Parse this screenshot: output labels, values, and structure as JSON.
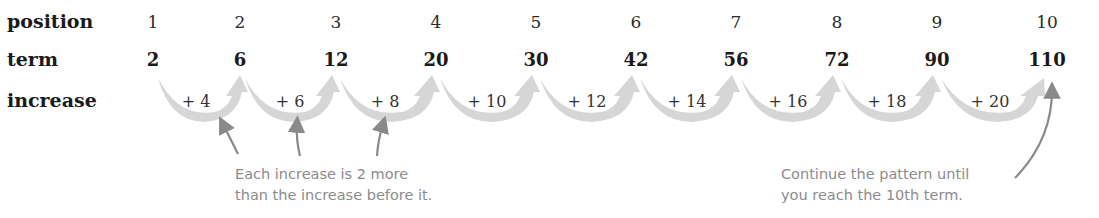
{
  "labels": {
    "position": "position",
    "term": "term",
    "increase": "increase"
  },
  "positions": [
    "1",
    "2",
    "3",
    "4",
    "5",
    "6",
    "7",
    "8",
    "9",
    "10"
  ],
  "terms": [
    "2",
    "6",
    "12",
    "20",
    "30",
    "42",
    "56",
    "72",
    "90",
    "110"
  ],
  "increases": [
    "+ 4",
    "+ 6",
    "+ 8",
    "+ 10",
    "+ 12",
    "+ 14",
    "+ 16",
    "+ 18",
    "+ 20"
  ],
  "notes": {
    "left_line1": "Each increase is 2 more",
    "left_line2": "than the increase before it.",
    "right_line1": "Continue the pattern until",
    "right_line2": "you reach the 10th term."
  },
  "colors": {
    "arrow_fill": "#d6d6d6",
    "pointer": "#8a8a8a",
    "note_text": "#8c8c8c"
  }
}
